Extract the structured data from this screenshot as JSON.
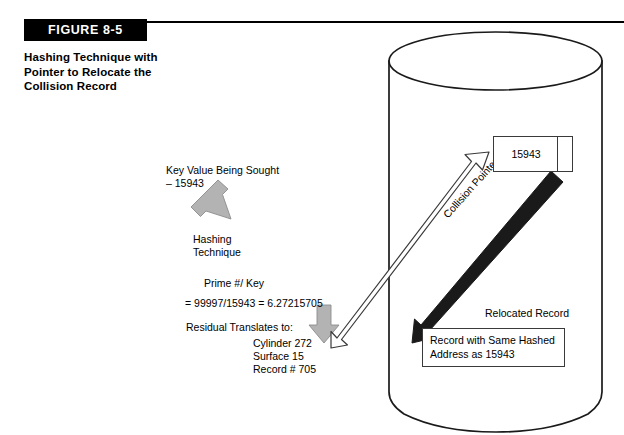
{
  "figure": {
    "tag_label": "FIGURE 8-5",
    "caption": "Hashing Technique with Pointer to Relocate the Collision Record"
  },
  "annotations": {
    "key_value": "Key Value Being Sought\n– 15943",
    "hashing_technique": "Hashing\nTechnique",
    "prime_over_key": "Prime #/ Key",
    "equation": "= 99997/15943 = 6.27215705",
    "residual_translates": "Residual Translates to:",
    "residual_detail": "Cylinder 272\nSurface 15\nRecord # 705",
    "collision_pointer": "Collision Pointer",
    "relocated_record_label": "Relocated Record"
  },
  "boxes": {
    "hashed_record_value": "15943",
    "relocated_record_text": "Record with Same Hashed Address as 15943"
  },
  "colors": {
    "ink": "#000000",
    "outline": "#3a3a3a",
    "gray_arrow_fill": "#b3b3b3",
    "gray_arrow_stroke": "#6e6e6e",
    "black_arrow": "#1a1a1a",
    "background": "#ffffff"
  },
  "shapes": {
    "cylinder_label": "disk-storage-cylinder"
  }
}
